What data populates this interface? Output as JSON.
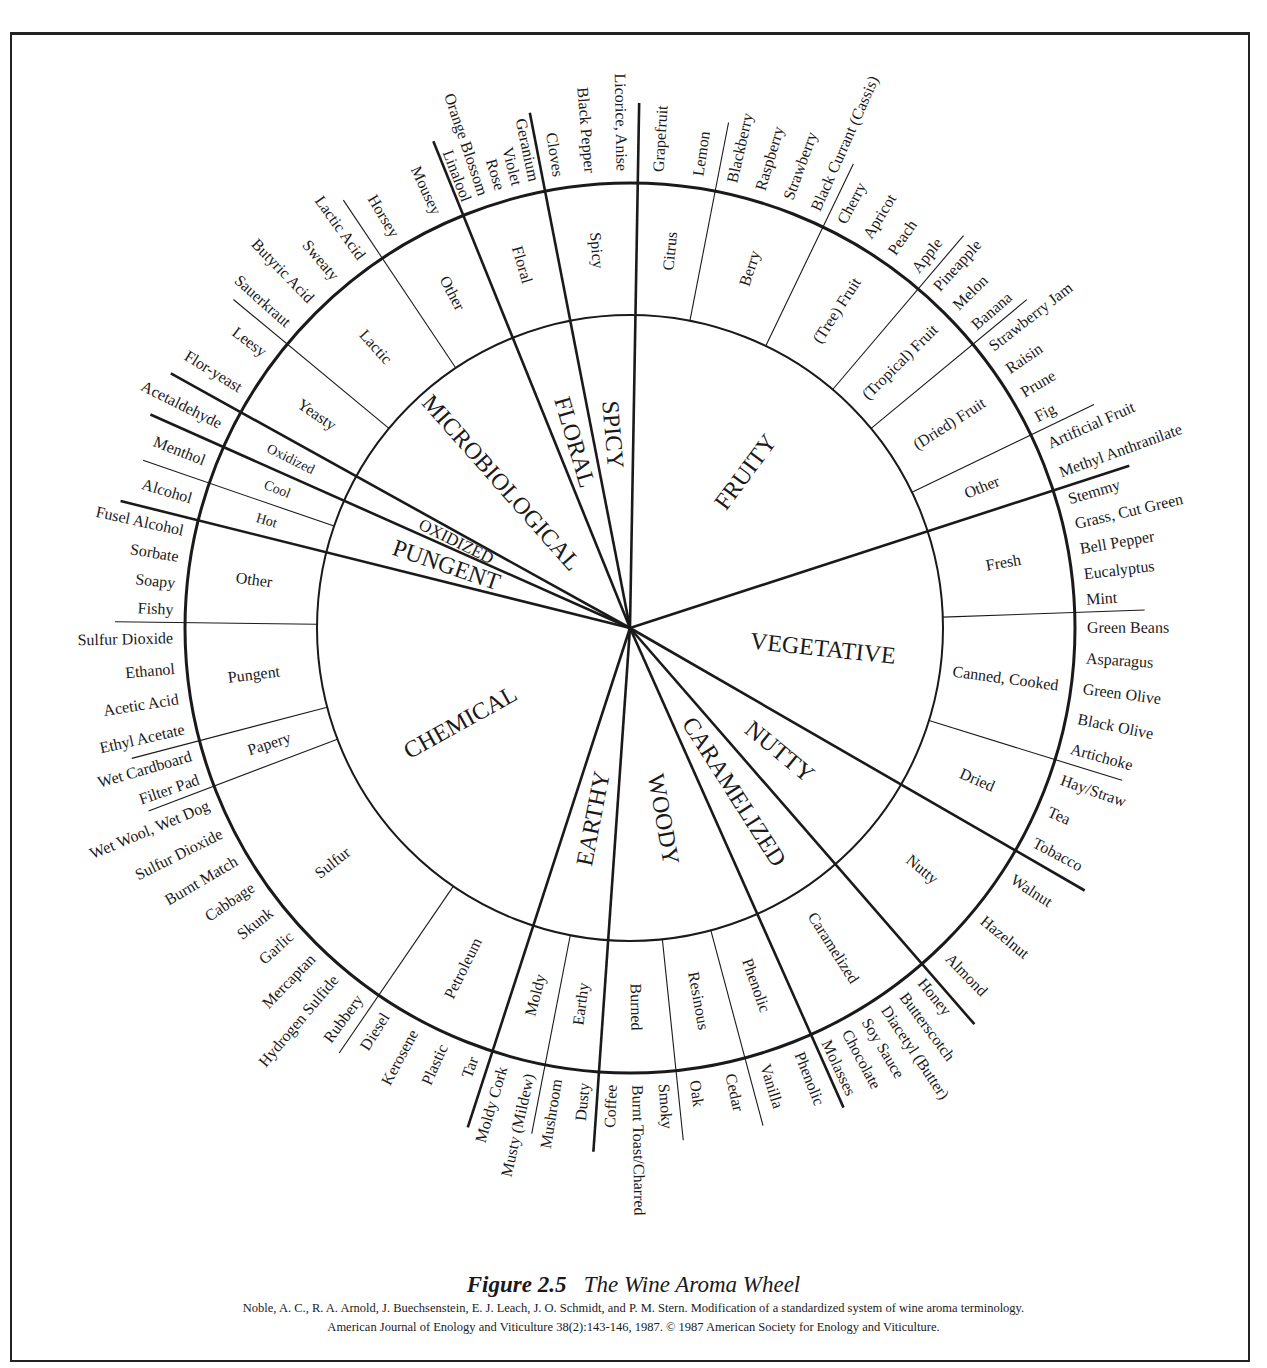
{
  "figure": {
    "number": "Figure 2.5",
    "title": "The Wine  Aroma Wheel",
    "citation_line1": "Noble, A. C., R. A. Arnold, J. Buechsenstein, E. J. Leach, J. O. Schmidt, and P. M. Stern.  Modification of a standardized system of wine aroma terminology.",
    "citation_line2": "American Journal of Enology and Viticulture 38(2):143-146, 1987.  © 1987 American Society for Enology and Viticulture."
  },
  "wheel": {
    "tiers": [
      "category",
      "subcategory",
      "descriptor"
    ],
    "categories": [
      {
        "name": "FRUITY",
        "subcategories": [
          {
            "name": "Citrus",
            "descriptors": [
              "Grapefruit",
              "Lemon"
            ]
          },
          {
            "name": "Berry",
            "descriptors": [
              "Blackberry",
              "Raspberry",
              "Strawberry",
              "Black Currant (Cassis)"
            ]
          },
          {
            "name": "(Tree) Fruit",
            "descriptors": [
              "Cherry",
              "Apricot",
              "Peach",
              "Apple"
            ]
          },
          {
            "name": "(Tropical) Fruit",
            "descriptors": [
              "Pineapple",
              "Melon",
              "Banana"
            ]
          },
          {
            "name": "(Dried) Fruit",
            "descriptors": [
              "Strawberry Jam",
              "Raisin",
              "Prune",
              "Fig"
            ]
          },
          {
            "name": "Other",
            "descriptors": [
              "Artificial Fruit",
              "Methyl Anthranilate"
            ]
          }
        ]
      },
      {
        "name": "VEGETATIVE",
        "subcategories": [
          {
            "name": "Fresh",
            "descriptors": [
              "Stemmy",
              "Grass, Cut Green",
              "Bell Pepper",
              "Eucalyptus",
              "Mint"
            ]
          },
          {
            "name": "Canned, Cooked",
            "descriptors": [
              "Green Beans",
              "Asparagus",
              "Green Olive",
              "Black Olive",
              "Artichoke"
            ]
          },
          {
            "name": "Dried",
            "descriptors": [
              "Hay/Straw",
              "Tea",
              "Tobacco"
            ]
          }
        ]
      },
      {
        "name": "NUTTY",
        "subcategories": [
          {
            "name": "Nutty",
            "descriptors": [
              "Walnut",
              "Hazelnut",
              "Almond"
            ]
          }
        ]
      },
      {
        "name": "CARAMELIZED",
        "subcategories": [
          {
            "name": "Caramelized",
            "descriptors": [
              "Honey",
              "Butterscotch",
              "Diacetyl (Butter)",
              "Soy Sauce",
              "Chocolate",
              "Molasses"
            ]
          }
        ]
      },
      {
        "name": "WOODY",
        "subcategories": [
          {
            "name": "Phenolic",
            "descriptors": [
              "Phenolic",
              "Vanilla"
            ]
          },
          {
            "name": "Resinous",
            "descriptors": [
              "Cedar",
              "Oak"
            ]
          },
          {
            "name": "Burned",
            "descriptors": [
              "Smoky",
              "Burnt Toast/Charred",
              "Coffee"
            ]
          }
        ]
      },
      {
        "name": "EARTHY",
        "subcategories": [
          {
            "name": "Earthy",
            "descriptors": [
              "Dusty",
              "Mushroom"
            ]
          },
          {
            "name": "Moldy",
            "descriptors": [
              "Musty (Mildew)",
              "Moldy Cork"
            ]
          }
        ]
      },
      {
        "name": "CHEMICAL",
        "subcategories": [
          {
            "name": "Petroleum",
            "descriptors": [
              "Tar",
              "Plastic",
              "Kerosene",
              "Diesel"
            ]
          },
          {
            "name": "Sulfur",
            "descriptors": [
              "Rubbery",
              "Hydrogen Sulfide",
              "Mercaptan",
              "Garlic",
              "Skunk",
              "Cabbage",
              "Burnt Match",
              "Sulfur Dioxide",
              "Wet Wool, Wet Dog"
            ]
          },
          {
            "name": "Papery",
            "descriptors": [
              "Filter Pad",
              "Wet Cardboard"
            ]
          },
          {
            "name": "Pungent",
            "descriptors": [
              "Ethyl Acetate",
              "Acetic Acid",
              "Ethanol",
              "Sulfur Dioxide"
            ]
          },
          {
            "name": "Other",
            "descriptors": [
              "Fishy",
              "Soapy",
              "Sorbate",
              "Fusel Alcohol"
            ]
          }
        ]
      },
      {
        "name": "PUNGENT",
        "subcategories": [
          {
            "name": "Hot",
            "descriptors": [
              "Alcohol"
            ]
          },
          {
            "name": "Cool",
            "descriptors": [
              "Menthol"
            ]
          }
        ]
      },
      {
        "name": "OXIDIZED",
        "subcategories": [
          {
            "name": "Oxidized",
            "descriptors": [
              "Acetaldehyde"
            ]
          }
        ]
      },
      {
        "name": "MICROBIOLOGICAL",
        "subcategories": [
          {
            "name": "Yeasty",
            "descriptors": [
              "Flor-yeast",
              "Leesy"
            ]
          },
          {
            "name": "Lactic",
            "descriptors": [
              "Sauerkraut",
              "Butyric Acid",
              "Sweaty",
              "Lactic Acid"
            ]
          },
          {
            "name": "Other",
            "descriptors": [
              "Horsey",
              "Mousey"
            ]
          }
        ]
      },
      {
        "name": "FLORAL",
        "subcategories": [
          {
            "name": "Linalool",
            "descriptors": [
              "Linalool",
              "Orange Blossom",
              "Rose",
              "Violet",
              "Geranium"
            ],
            "is_descriptor_only": true,
            "label": "Floral"
          }
        ]
      },
      {
        "name": "SPICY",
        "subcategories": [
          {
            "name": "Spicy",
            "descriptors": [
              "Cloves",
              "Black Pepper",
              "Licorice, Anise"
            ]
          }
        ]
      }
    ]
  }
}
